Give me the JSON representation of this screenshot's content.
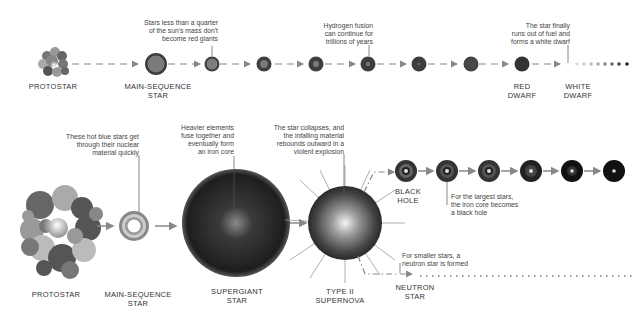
{
  "top_row": {
    "title": "Life cycle of low-mass stars",
    "stages": {
      "protostar": "PROTOSTAR",
      "main_sequence": "MAIN-SEQUENCE\nSTAR",
      "red_dwarf": "RED\nDWARF",
      "white_dwarf": "WHITE\nDWARF"
    },
    "notes": {
      "quarter_mass": "Stars less than a quarter\nof the sun's mass don't\nbecome red giants",
      "hydrogen": "Hydrogen fusion\ncan continue for\ntrillions of years",
      "white_dwarf": "The star finally\nruns out of fuel and\nforms a white dwarf"
    }
  },
  "bottom_row": {
    "title": "Life cycle of high-mass stars",
    "stages": {
      "protostar": "PROTOSTAR",
      "main_sequence": "MAIN-SEQUENCE\nSTAR",
      "supergiant": "SUPERGIANT\nSTAR",
      "supernova": "TYPE II\nSUPERNOVA",
      "black_hole": "BLACK\nHOLE",
      "neutron_star": "NEUTRON\nSTAR"
    },
    "notes": {
      "blue_stars": "These hot blue stars get\nthrough their nuclear\nmaterial quickly",
      "iron_core": "Heavier elements\nfuse together and\neventually form\nan iron core",
      "collapse": "The star collapses, and\nthe infalling material\nrebounds outward in a\nviolent explosion",
      "largest_stars": "For the largest stars,\nthe iron core becomes\na black hole",
      "smaller_stars": "For smaller stars, a\nneutron star is formed"
    }
  },
  "colors": {
    "arrow": "#888888",
    "star_dark": "#3a3a3a",
    "star_mid": "#7a7a7a",
    "text": "#333333"
  }
}
